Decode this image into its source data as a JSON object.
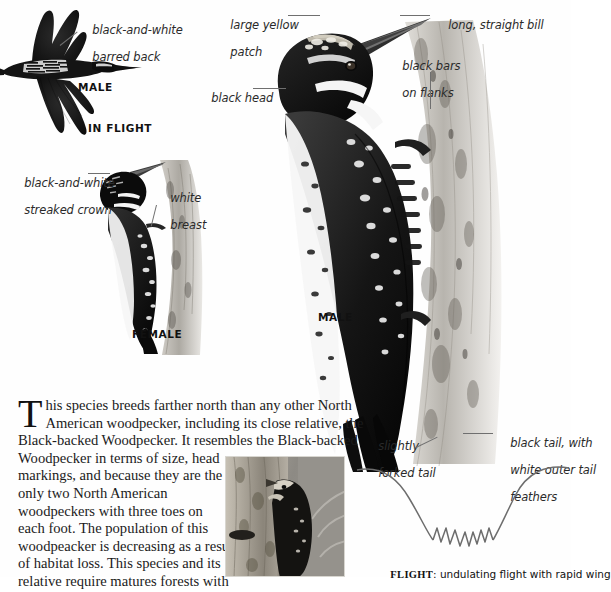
{
  "page": {
    "background_color": "#ffffff",
    "text_color": "#1b1b1b",
    "label_color": "#2a2a2a",
    "leader_color": "#6f6f6f"
  },
  "flight_bird": {
    "caption_sex": "MALE",
    "caption_pose": "IN FLIGHT",
    "labels": [
      {
        "id": "barred-back",
        "line1": "black-and-white",
        "line2": "barred back"
      }
    ]
  },
  "female_bird": {
    "caption_sex": "FEMALE",
    "labels": [
      {
        "id": "streaked-crown",
        "line1": "black-and-white",
        "line2": "streaked crown"
      },
      {
        "id": "white-breast",
        "line1": "white",
        "line2": "breast"
      }
    ]
  },
  "male_bird": {
    "caption_sex": "MALE",
    "labels": [
      {
        "id": "yellow-patch",
        "line1": "large yellow",
        "line2": "patch"
      },
      {
        "id": "black-head",
        "line1": "black head",
        "line2": ""
      },
      {
        "id": "long-bill",
        "line1": "long, straight bill",
        "line2": ""
      },
      {
        "id": "black-bars-flanks",
        "line1": "black bars",
        "line2": "on flanks"
      },
      {
        "id": "forked-tail",
        "line1": "slightly",
        "line2": "forked tail"
      },
      {
        "id": "black-tail",
        "line1": "black tail, with",
        "line2": "white outer tail",
        "line3": "feathers"
      }
    ]
  },
  "body": {
    "dropcap": "T",
    "lines": [
      "his species breeds farther north than any other North",
      "American woodpecker, including its close relative, the",
      "Black-backed Woodpecker. It resembles the Black-backed",
      "Woodpecker in terms of size, head",
      "markings, and because they are the",
      "only two North American",
      "woodpeckers with three toes on",
      "each foot. The population of this",
      "woodpeacker is decreasing as a result",
      "of habitat loss. This species and its",
      "relative require matures forests with"
    ]
  },
  "flight_diagram": {
    "caption_label": "FLIGHT",
    "caption_text": ": undulating flight with rapid wing"
  }
}
